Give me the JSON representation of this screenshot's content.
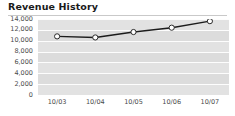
{
  "widget": {
    "title": "Revenue History",
    "background_color": "#ffffff",
    "divider_color": "#c9c9c9"
  },
  "chart_data": {
    "type": "line",
    "title": "Revenue History",
    "xlabel": "",
    "ylabel": "",
    "categories": [
      "10/03",
      "10/04",
      "10/05",
      "10/06",
      "10/07"
    ],
    "series": [
      {
        "name": "Revenue",
        "values": [
          10800,
          10600,
          11600,
          12400,
          13600
        ]
      }
    ],
    "ylim": [
      0,
      14000
    ],
    "y_ticks": [
      0,
      2000,
      4000,
      6000,
      8000,
      10000,
      12000,
      14000
    ],
    "y_tick_labels": [
      "0",
      "2,000",
      "4,000",
      "6,000",
      "8,000",
      "10,000",
      "12,000",
      "14,000"
    ],
    "x_tick_labels": [
      "10/03",
      "10/04",
      "10/05",
      "10/06",
      "10/07"
    ],
    "grid": true,
    "legend": false,
    "legend_position": "none",
    "plot_background_color": "#e2e2e2",
    "gridline_color": "#fdfdfd",
    "line_color": "#1c1c1c",
    "marker_fill_color": "#ffffff",
    "marker_edge_color": "#2a2a2a",
    "axis_label_color": "#4a4a4a"
  }
}
